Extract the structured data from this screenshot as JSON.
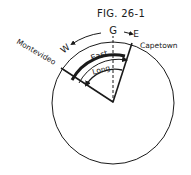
{
  "figure": {
    "title": "FIG. 26-1",
    "labels": {
      "greenwich": "G",
      "west": "W",
      "east_dir": "E",
      "montevideo": "Montevideo",
      "capetown": "Capetown",
      "east_arc": "East",
      "long_arc": "Long."
    },
    "colors": {
      "ink": "#1a1a1a",
      "background": "#ffffff"
    }
  }
}
